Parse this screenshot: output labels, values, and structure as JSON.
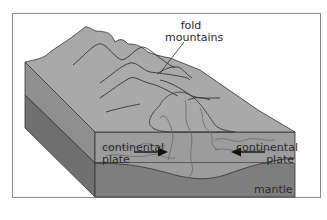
{
  "diagram": {
    "labels": {
      "fold_mountains_line1": "fold",
      "fold_mountains_line2": "mountains",
      "left_plate_line1": "continental",
      "left_plate_line2": "plate",
      "right_plate_line1": "continental",
      "right_plate_line2": "plate",
      "mantle": "mantle"
    },
    "arrows": [
      {
        "label": "left-plate-motion",
        "direction": "right"
      },
      {
        "label": "right-plate-motion",
        "direction": "left"
      }
    ],
    "colors": {
      "top_surface": "#a9a9a9",
      "crust_front": "#9c9c9c",
      "mantle_front": "#7e7e7e",
      "left_side_upper": "#8f8f8f",
      "left_side_lower": "#707070",
      "outline": "#333333",
      "frame": "#8a8a8a"
    }
  }
}
